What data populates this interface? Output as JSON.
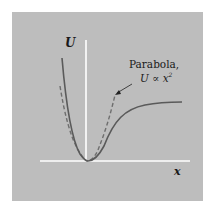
{
  "figure": {
    "y_axis_label": "U",
    "x_axis_label": "x",
    "annotation": {
      "line1": "Parabola,",
      "line2_prefix": "U ∝ x",
      "line2_exp": "2"
    },
    "colors": {
      "panel": "#bdbdbd",
      "axes": "#ffffff",
      "curve": "#5a5a5a",
      "dashed": "#6e6e6e",
      "text": "#1a1a1a"
    },
    "curves": [
      {
        "name": "potential-energy",
        "style": "solid",
        "description": "asymmetric potential well: steep wall left, minimum at origin, flattens toward asymptote on right"
      },
      {
        "name": "parabola-approximation",
        "style": "dashed",
        "description": "parabola U ∝ x² matching well near the minimum"
      }
    ]
  }
}
